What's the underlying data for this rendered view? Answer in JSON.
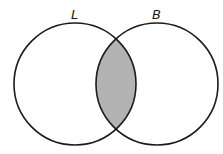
{
  "diagram": {
    "type": "venn",
    "sets": [
      {
        "label": "L",
        "cx": 75,
        "cy": 84,
        "r": 61
      },
      {
        "label": "B",
        "cx": 157,
        "cy": 84,
        "r": 61
      }
    ],
    "shaded_region": "L ∩ B",
    "colors": {
      "stroke": "#1a1a1a",
      "shade": "#b3b3b3",
      "background": "#ffffff"
    }
  }
}
